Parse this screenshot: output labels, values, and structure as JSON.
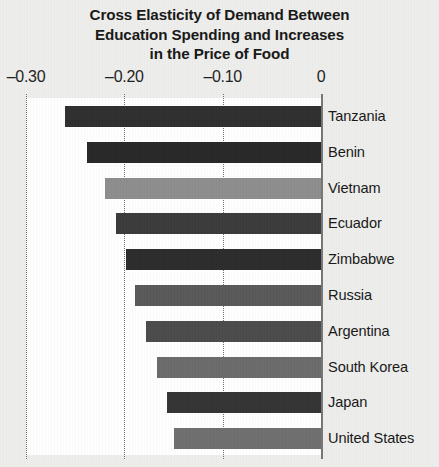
{
  "chart_data": {
    "type": "bar",
    "orientation": "horizontal",
    "title": "Cross Elasticity of Demand Between Education Spending and Increases in the Price of Food",
    "title_lines": [
      "Cross Elasticity of Demand Between",
      "Education Spending and Increases",
      "in the Price of Food"
    ],
    "xlabel": "",
    "ylabel": "",
    "xlim": [
      -0.3,
      0
    ],
    "xticks": [
      -0.3,
      -0.2,
      -0.1,
      0
    ],
    "xtick_labels": [
      "–0.30",
      "–0.20",
      "–0.10",
      "0"
    ],
    "grid": "vertical-dotted",
    "legend": "none",
    "categories": [
      "Tanzania",
      "Benin",
      "Vietnam",
      "Ecuador",
      "Zimbabwe",
      "Russia",
      "Argentina",
      "South Korea",
      "Japan",
      "United States"
    ],
    "values": [
      -0.26,
      -0.238,
      -0.22,
      -0.208,
      -0.198,
      -0.189,
      -0.178,
      -0.167,
      -0.157,
      -0.149
    ],
    "bar_colors": [
      "#2e2e2e",
      "#262626",
      "#8d8d8d",
      "#3a3a3a",
      "#2b2b2b",
      "#585858",
      "#4a4a4a",
      "#6a6a6a",
      "#333333",
      "#6e6e6e"
    ],
    "bars": [
      {
        "label": "Tanzania",
        "value": -0.26,
        "color": "#2e2e2e"
      },
      {
        "label": "Benin",
        "value": -0.238,
        "color": "#262626"
      },
      {
        "label": "Vietnam",
        "value": -0.22,
        "color": "#8d8d8d"
      },
      {
        "label": "Ecuador",
        "value": -0.208,
        "color": "#3a3a3a"
      },
      {
        "label": "Zimbabwe",
        "value": -0.198,
        "color": "#2b2b2b"
      },
      {
        "label": "Russia",
        "value": -0.189,
        "color": "#585858"
      },
      {
        "label": "Argentina",
        "value": -0.178,
        "color": "#4a4a4a"
      },
      {
        "label": "South Korea",
        "value": -0.167,
        "color": "#6a6a6a"
      },
      {
        "label": "Japan",
        "value": -0.157,
        "color": "#333333"
      },
      {
        "label": "United States",
        "value": -0.149,
        "color": "#6e6e6e"
      }
    ]
  },
  "style": {
    "page_background": "#eeeeec",
    "plot_background": "#ffffff",
    "axis_color": "#767676",
    "gridline_color": "#6e6e6e",
    "text_color": "#161616"
  }
}
